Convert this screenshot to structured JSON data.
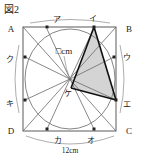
{
  "figure": {
    "title": "図2",
    "shape_type": "square-with-inscribed-circle",
    "square": {
      "corners": [
        {
          "name": "A",
          "label": "A",
          "position": "top-left"
        },
        {
          "name": "B",
          "label": "B",
          "position": "top-right"
        },
        {
          "name": "C",
          "label": "C",
          "position": "bottom-right"
        },
        {
          "name": "D",
          "label": "D",
          "position": "bottom-left"
        }
      ],
      "side_length_label": "12cm"
    },
    "circle_points": [
      {
        "label": "ア",
        "position": "top-left-arc"
      },
      {
        "label": "イ",
        "position": "top-right-arc"
      },
      {
        "label": "ウ",
        "position": "right-upper-arc"
      },
      {
        "label": "エ",
        "position": "right-lower-arc"
      },
      {
        "label": "オ",
        "position": "bottom-right-arc"
      },
      {
        "label": "カ",
        "position": "bottom-left-arc"
      },
      {
        "label": "キ",
        "position": "left-lower-arc"
      },
      {
        "label": "ク",
        "position": "left-upper-arc"
      }
    ],
    "center_point": {
      "label": "ケ"
    },
    "unknown_label": "□cm",
    "dimension_label": "12cm",
    "shaded_triangle": {
      "vertices": [
        "イ",
        "ケ",
        "エ"
      ],
      "fill_color": "#d4d4d4"
    },
    "colors": {
      "stroke": "#4a4a4a",
      "heavy_stroke": "#1a1a1a",
      "shade": "#d4d4d4",
      "background": "#ffffff",
      "text": "#1a1a1a"
    }
  }
}
